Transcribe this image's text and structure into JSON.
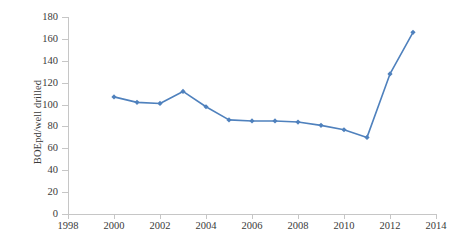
{
  "chart_data": {
    "type": "line",
    "title": "",
    "xlabel": "",
    "ylabel": "BOEpd/well drilled",
    "x": [
      2000,
      2001,
      2002,
      2003,
      2004,
      2005,
      2006,
      2007,
      2008,
      2009,
      2010,
      2011,
      2012,
      2013
    ],
    "values": [
      107,
      102,
      101,
      112,
      98,
      86,
      85,
      85,
      84,
      81,
      77,
      70,
      128,
      166
    ],
    "series": [
      {
        "name": "BOEpd/well drilled",
        "values": [
          107,
          102,
          101,
          112,
          98,
          86,
          85,
          85,
          84,
          81,
          77,
          70,
          128,
          166
        ]
      }
    ],
    "xlim": [
      1998,
      2014
    ],
    "ylim": [
      0,
      180
    ],
    "xticks": [
      1998,
      2000,
      2002,
      2004,
      2006,
      2008,
      2010,
      2012,
      2014
    ],
    "xtick_labels": [
      "1998",
      "2000",
      "2002",
      "2004",
      "2006",
      "2008",
      "2010",
      "2012",
      "2014"
    ],
    "yticks": [
      0,
      20,
      40,
      60,
      80,
      100,
      120,
      140,
      160,
      180
    ],
    "ytick_labels": [
      "0",
      "20",
      "40",
      "60",
      "80",
      "100",
      "120",
      "140",
      "160",
      "180"
    ],
    "grid": false,
    "legend": "none",
    "marker": "diamond",
    "series_color": "#4f81bd",
    "axis_color": "#c6c6c6",
    "text_color": "#3a3a3a",
    "background": "#ffffff"
  }
}
